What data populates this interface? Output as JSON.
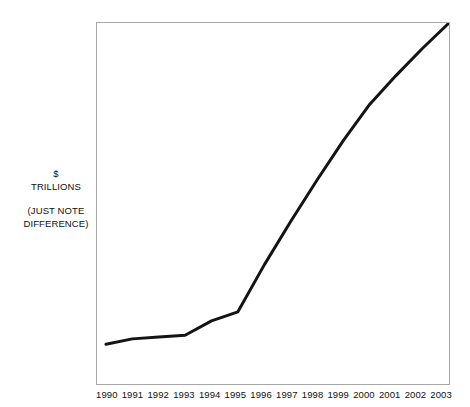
{
  "chart_data": {
    "type": "line",
    "title": "",
    "subtitle": "",
    "xlabel": "",
    "ylabel": "$ TRILLIONS",
    "ylabel_note": "(JUST NOTE DIFFERENCE)",
    "grid": false,
    "legend": null,
    "axis_ticks_visible": false,
    "y_tick_labels": [],
    "ylim_note": "no numeric y scale printed; axis is unlabeled",
    "x": [
      1990,
      1991,
      1992,
      1993,
      1994,
      1995,
      1996,
      1997,
      1998,
      1999,
      2000,
      2001,
      2002,
      2003
    ],
    "categories": [
      "1990",
      "1991",
      "1992",
      "1993",
      "1994",
      "1995",
      "1996",
      "1997",
      "1998",
      "1999",
      "2000",
      "2001",
      "2002",
      "2003"
    ],
    "series": [
      {
        "name": "$ trillions",
        "values_normalized": [
          0.11,
          0.125,
          0.13,
          0.135,
          0.175,
          0.2,
          0.33,
          0.45,
          0.565,
          0.675,
          0.775,
          0.855,
          0.93,
          1.0
        ]
      }
    ],
    "annotations": [],
    "line_color": "#141414",
    "line_width_px": 3,
    "frame_color": "#a8a8a8",
    "background_color": "#ffffff"
  },
  "axes": {
    "y_caption_unit": "$",
    "y_caption_unit_2": "TRILLIONS",
    "y_caption_note_1": "(JUST NOTE",
    "y_caption_note_2": "DIFFERENCE)"
  }
}
